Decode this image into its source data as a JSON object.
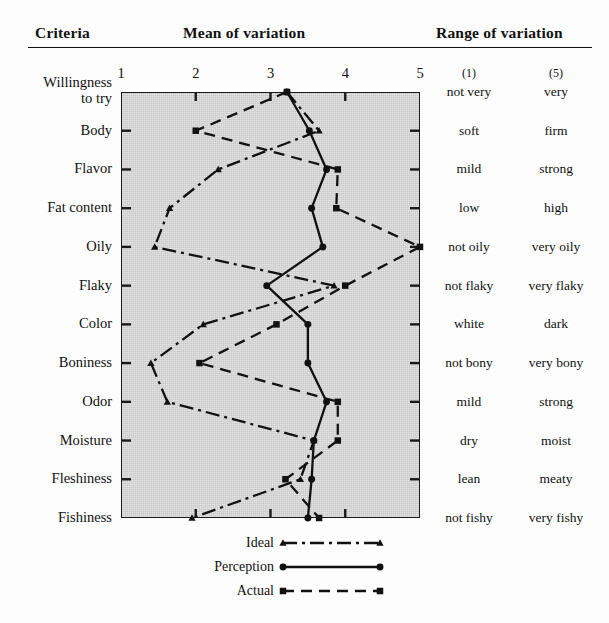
{
  "header": {
    "criteria": "Criteria",
    "mean": "Mean of variation",
    "range": "Range of variation"
  },
  "axis": {
    "ticks": [
      "1",
      "2",
      "3",
      "4",
      "5"
    ],
    "range_low_header": "(1)",
    "range_high_header": "(5)"
  },
  "legend": {
    "items": [
      {
        "label": "Ideal",
        "marker": "triangle",
        "dash": "dash-dot",
        "color": "#111111"
      },
      {
        "label": "Perception",
        "marker": "circle",
        "dash": "solid",
        "color": "#111111"
      },
      {
        "label": "Actual",
        "marker": "square",
        "dash": "dashed",
        "color": "#111111"
      }
    ]
  },
  "chart_data": {
    "type": "line",
    "title": "Mean of variation",
    "xlabel": "Mean of variation",
    "ylabel": "Criteria",
    "xlim": [
      1,
      5
    ],
    "xticks": [
      1,
      2,
      3,
      4,
      5
    ],
    "grid": false,
    "orientation": "horizontal",
    "legend_position": "bottom",
    "categories": [
      "Willingness to try",
      "Body",
      "Flavor",
      "Fat content",
      "Oily",
      "Flaky",
      "Color",
      "Boniness",
      "Odor",
      "Moisture",
      "Fleshiness",
      "Fishiness"
    ],
    "range_labels": [
      {
        "low": "not very",
        "high": "very"
      },
      {
        "low": "soft",
        "high": "firm"
      },
      {
        "low": "mild",
        "high": "strong"
      },
      {
        "low": "low",
        "high": "high"
      },
      {
        "low": "not oily",
        "high": "very oily"
      },
      {
        "low": "not flaky",
        "high": "very flaky"
      },
      {
        "low": "white",
        "high": "dark"
      },
      {
        "low": "not bony",
        "high": "very bony"
      },
      {
        "low": "mild",
        "high": "strong"
      },
      {
        "low": "dry",
        "high": "moist"
      },
      {
        "low": "lean",
        "high": "meaty"
      },
      {
        "low": "not fishy",
        "high": "very fishy"
      }
    ],
    "series": [
      {
        "name": "Ideal",
        "marker": "triangle",
        "dash": "dash-dot",
        "values": [
          3.22,
          3.65,
          2.3,
          1.65,
          1.45,
          3.85,
          2.1,
          1.4,
          1.62,
          3.58,
          3.4,
          1.95
        ]
      },
      {
        "name": "Perception",
        "marker": "circle",
        "dash": "solid",
        "values": [
          3.22,
          3.52,
          3.75,
          3.55,
          3.7,
          2.95,
          3.5,
          3.5,
          3.75,
          3.58,
          3.55,
          3.5
        ]
      },
      {
        "name": "Actual",
        "marker": "square",
        "dash": "dashed",
        "values": [
          3.22,
          2.0,
          3.9,
          3.88,
          5.0,
          4.0,
          3.08,
          2.05,
          3.9,
          3.9,
          3.2,
          3.65
        ]
      }
    ]
  }
}
